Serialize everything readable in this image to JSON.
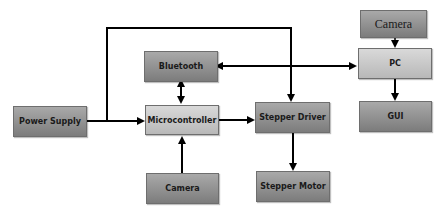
{
  "diagram": {
    "type": "block-diagram",
    "nodes": [
      {
        "id": "power_supply",
        "label": "Power Supply"
      },
      {
        "id": "microcontroller",
        "label": "Microcontroller"
      },
      {
        "id": "bluetooth",
        "label": "Bluetooth"
      },
      {
        "id": "camera_mcu",
        "label": "Camera"
      },
      {
        "id": "stepper_driver",
        "label": "Stepper Driver"
      },
      {
        "id": "stepper_motor",
        "label": "Stepper Motor"
      },
      {
        "id": "camera_pc",
        "label": "Camera"
      },
      {
        "id": "pc",
        "label": "PC"
      },
      {
        "id": "gui",
        "label": "GUI"
      }
    ],
    "edges": [
      {
        "from": "power_supply",
        "to": "microcontroller",
        "direction": "forward"
      },
      {
        "from": "power_supply",
        "to": "stepper_driver",
        "direction": "forward"
      },
      {
        "from": "bluetooth",
        "to": "microcontroller",
        "direction": "bidirectional"
      },
      {
        "from": "camera_mcu",
        "to": "microcontroller",
        "direction": "forward"
      },
      {
        "from": "microcontroller",
        "to": "stepper_driver",
        "direction": "forward"
      },
      {
        "from": "stepper_driver",
        "to": "stepper_motor",
        "direction": "forward"
      },
      {
        "from": "bluetooth",
        "to": "pc",
        "direction": "bidirectional"
      },
      {
        "from": "camera_pc",
        "to": "pc",
        "direction": "forward"
      },
      {
        "from": "pc",
        "to": "gui",
        "direction": "forward"
      }
    ]
  },
  "colors": {
    "box_dark": "#8e8e8e",
    "box_light": "#c8c8c8",
    "line": "#000000"
  }
}
